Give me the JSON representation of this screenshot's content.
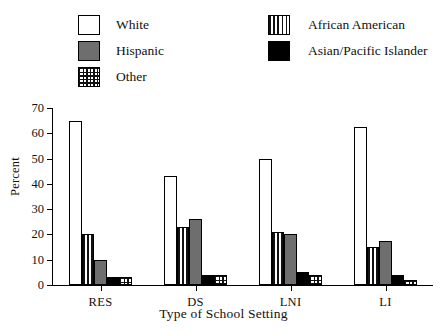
{
  "chart_data": {
    "type": "bar",
    "title": "",
    "xlabel": "Type of School Setting",
    "ylabel": "Percent",
    "categories": [
      "RES",
      "DS",
      "LNI",
      "LI"
    ],
    "ylim": [
      0,
      70
    ],
    "yticks": [
      0,
      10,
      20,
      30,
      40,
      50,
      60,
      70
    ],
    "grid": false,
    "legend_position": "top",
    "series": [
      {
        "name": "White",
        "fill": "white",
        "values": [
          65,
          43,
          50,
          62.5
        ]
      },
      {
        "name": "African American",
        "fill": "vertical-stripes",
        "values": [
          20,
          23,
          21,
          15
        ]
      },
      {
        "name": "Hispanic",
        "fill": "solid-gray",
        "values": [
          10,
          26,
          20,
          17.5
        ]
      },
      {
        "name": "Asian/Pacific Islander",
        "fill": "solid-black",
        "values": [
          3,
          4,
          5,
          4
        ]
      },
      {
        "name": "Other",
        "fill": "crosshatch-grid",
        "values": [
          3,
          4,
          4,
          2
        ]
      }
    ]
  },
  "legend": {
    "left_column": [
      {
        "label": "White",
        "fill": "white"
      },
      {
        "label": "Hispanic",
        "fill": "solid-gray"
      },
      {
        "label": "Other",
        "fill": "crosshatch-grid"
      }
    ],
    "right_column": [
      {
        "label": "African American",
        "fill": "vertical-stripes"
      },
      {
        "label": "Asian/Pacific Islander",
        "fill": "solid-black"
      }
    ]
  },
  "colors": {
    "axis": "#000000",
    "gray_fill": "#6e6e6e",
    "black_fill": "#000000",
    "background": "#ffffff"
  }
}
